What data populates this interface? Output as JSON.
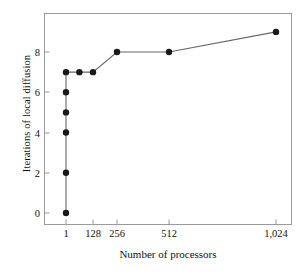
{
  "chart_data": {
    "type": "line",
    "title": "",
    "xlabel": "Number of processors",
    "ylabel": "Iterations of local diffusion",
    "xlim": [
      0,
      1088
    ],
    "ylim": [
      -0.6,
      9.6
    ],
    "grid": false,
    "legend": "none",
    "marker": "filled-circle",
    "line_color": "#555555",
    "marker_color": "#1a1a1a",
    "x_tick_values": [
      1,
      128,
      256,
      512,
      1024
    ],
    "x_tick_labels": [
      "1",
      "128",
      "256",
      "512",
      "1,024"
    ],
    "y_tick_values": [
      0,
      2,
      4,
      6,
      8
    ],
    "y_tick_labels": [
      "0",
      "2",
      "4",
      "6",
      "8"
    ],
    "x": [
      1,
      1,
      1,
      1,
      1,
      1,
      64,
      128,
      256,
      512,
      1024
    ],
    "values": [
      0,
      2,
      4,
      5,
      6,
      7,
      7,
      7,
      8,
      8,
      9
    ],
    "points": [
      {
        "x": 1,
        "y": 0
      },
      {
        "x": 1,
        "y": 2
      },
      {
        "x": 1,
        "y": 4
      },
      {
        "x": 1,
        "y": 5
      },
      {
        "x": 1,
        "y": 6
      },
      {
        "x": 1,
        "y": 7
      },
      {
        "x": 64,
        "y": 7
      },
      {
        "x": 128,
        "y": 7
      },
      {
        "x": 256,
        "y": 8
      },
      {
        "x": 512,
        "y": 8
      },
      {
        "x": 1024,
        "y": 9
      }
    ]
  },
  "axes": {
    "x_title": "Number of processors",
    "y_title": "Iterations of local diffusion"
  },
  "ticks": {
    "x": [
      {
        "label": "1",
        "px": 66
      },
      {
        "label": "128",
        "px": 93
      },
      {
        "label": "256",
        "px": 117
      },
      {
        "label": "512",
        "px": 169
      },
      {
        "label": "1,024",
        "px": 276
      }
    ],
    "y": [
      {
        "label": "0",
        "px": 213
      },
      {
        "label": "2",
        "px": 173
      },
      {
        "label": "4",
        "px": 133
      },
      {
        "label": "6",
        "px": 92
      },
      {
        "label": "8",
        "px": 52
      }
    ]
  }
}
